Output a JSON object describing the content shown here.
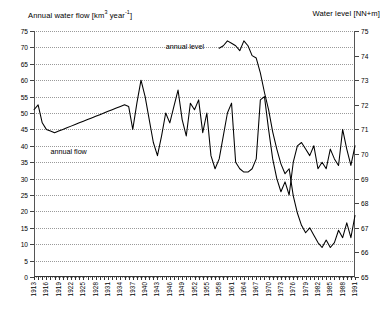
{
  "header": {
    "left_title": "Annual water flow [km",
    "left_title_sup": "3",
    "left_title_mid": " year",
    "left_title_sup2": "-1",
    "left_title_end": "]",
    "left_title_full": "Annual water flow [km3 year-1]",
    "right_title": "Water level [NN+m]"
  },
  "annotations": {
    "flow_label": "annual flow",
    "level_label": "annual level"
  },
  "chart_data": {
    "type": "line",
    "title": "",
    "xlabel": "",
    "ylabel": "Annual water flow [km3 year-1]",
    "y2label": "Water level [NN+m]",
    "grid": true,
    "legend": "inline-annotations",
    "ylim": [
      0,
      75
    ],
    "yticks": [
      0,
      5,
      10,
      15,
      20,
      25,
      30,
      35,
      40,
      45,
      50,
      55,
      60,
      65,
      70,
      75
    ],
    "y2lim": [
      65,
      75
    ],
    "y2ticks": [
      65,
      66,
      67,
      68,
      69,
      70,
      71,
      72,
      73,
      74,
      75
    ],
    "xlim": [
      1913,
      1991
    ],
    "xtick_step": 1,
    "xticklabel_step": 3,
    "xticklabels": [
      "1913",
      "1916",
      "1919",
      "1922",
      "1925",
      "1928",
      "1931",
      "1934",
      "1937",
      "1940",
      "1943",
      "1946",
      "1949",
      "1952",
      "1955",
      "1958",
      "1961",
      "1964",
      "1967",
      "1970",
      "1973",
      "1976",
      "1979",
      "1982",
      "1985",
      "1988",
      "1991"
    ],
    "series": [
      {
        "name": "annual flow",
        "axis": "left",
        "units": "km3 year-1",
        "x": [
          1913,
          1914,
          1915,
          1916,
          1917,
          1918,
          1919,
          1920,
          1921,
          1922,
          1923,
          1924,
          1925,
          1926,
          1927,
          1928,
          1929,
          1930,
          1931,
          1932,
          1933,
          1934,
          1935,
          1936,
          1937,
          1938,
          1939,
          1940,
          1941,
          1942,
          1943,
          1944,
          1945,
          1946,
          1947,
          1948,
          1949,
          1950,
          1951,
          1952,
          1953,
          1954,
          1955,
          1956,
          1957,
          1958,
          1959,
          1960,
          1961,
          1962,
          1963,
          1964,
          1965,
          1966,
          1967,
          1968,
          1969,
          1970,
          1971,
          1972,
          1973,
          1974,
          1975,
          1976,
          1977,
          1978,
          1979,
          1980,
          1981,
          1982,
          1983,
          1984,
          1985,
          1986,
          1987,
          1988,
          1989,
          1990,
          1991
        ],
        "values": [
          51,
          52.5,
          47,
          45,
          44.5,
          44,
          44.5,
          45,
          45.5,
          46,
          46.5,
          47,
          47.5,
          48,
          48.5,
          49,
          49.5,
          50,
          50.5,
          51,
          51.5,
          52,
          52.5,
          52,
          45,
          53,
          60,
          55,
          48,
          41,
          37,
          43,
          50,
          47,
          52,
          57,
          48,
          43,
          53,
          51,
          54,
          44,
          50,
          37,
          33,
          36,
          43,
          50,
          53,
          35,
          33,
          32,
          32,
          33,
          36,
          54,
          55,
          45,
          36,
          30,
          26,
          29,
          25,
          35,
          40,
          41,
          39,
          37,
          40,
          33,
          35,
          33,
          39,
          36,
          34,
          45,
          39,
          34,
          40
        ]
      },
      {
        "name": "annual level",
        "axis": "right",
        "units": "NN+m",
        "x": [
          1958,
          1959,
          1960,
          1961,
          1962,
          1963,
          1964,
          1965,
          1966,
          1967,
          1968,
          1969,
          1970,
          1971,
          1972,
          1973,
          1974,
          1975,
          1976,
          1977,
          1978,
          1979,
          1980,
          1981,
          1982,
          1983,
          1984,
          1985,
          1986,
          1987,
          1988,
          1989,
          1990,
          1991
        ],
        "values": [
          74.3,
          74.4,
          74.6,
          74.5,
          74.4,
          74.2,
          74.6,
          74.4,
          74.0,
          73.9,
          73.3,
          72.5,
          71.8,
          70.9,
          70.2,
          69.6,
          69.2,
          69.4,
          68.3,
          67.6,
          67.1,
          66.8,
          67.0,
          66.7,
          66.4,
          66.2,
          66.5,
          66.2,
          66.4,
          66.9,
          66.6,
          67.2,
          66.6,
          67.5
        ]
      }
    ]
  }
}
